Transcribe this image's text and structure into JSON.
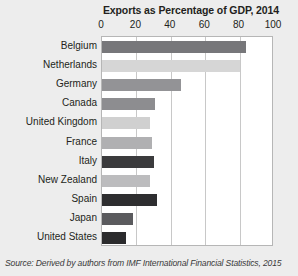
{
  "chart_data": {
    "type": "bar",
    "orientation": "horizontal",
    "title": "Exports as Percentage of GDP, 2014",
    "xlabel": "",
    "ylabel": "",
    "xlim": [
      0,
      100
    ],
    "xticks": [
      0,
      20,
      40,
      60,
      80,
      100
    ],
    "xtick_labels": [
      "0",
      "20",
      "40",
      "60",
      "80",
      "100"
    ],
    "grid": true,
    "legend": "none",
    "categories": [
      "Belgium",
      "Netherlands",
      "Germany",
      "Canada",
      "United Kingdom",
      "France",
      "Italy",
      "New Zealand",
      "Spain",
      "Japan",
      "United States"
    ],
    "values": [
      84,
      80,
      46,
      31,
      28,
      29,
      30,
      28,
      32,
      18,
      14
    ],
    "bar_colors": [
      "#77777a",
      "#d6d6d6",
      "#939396",
      "#8d8d90",
      "#d0d0d0",
      "#b0b0b2",
      "#3b3b3d",
      "#bcbcbe",
      "#2e2e30",
      "#5b5b5e",
      "#2b2b2d"
    ],
    "source": "Source: Derived by authors from IMF International Financial Statistics, 2015",
    "source_prefix": "Source: Derived by authors from ",
    "source_emphasis": "IMF International Financial Statistics",
    "source_suffix": ", 2015"
  },
  "style": {
    "background": "#ededed",
    "plot_background": "#ffffff",
    "gridline_color": "#c8c8c8",
    "frame_color": "#b6b6b6",
    "text_color": "#231f20"
  }
}
